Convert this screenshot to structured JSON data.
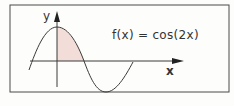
{
  "diagram": {
    "function_label": "f(x) = cos(2x)",
    "x_axis_label": "x",
    "y_axis_label": "y",
    "shaded_region": "area under curve from x=0 to first zero",
    "colors": {
      "line": "#3a3a3a",
      "shade": "#f2ddd8",
      "frame": "#4a4a4a",
      "background": "#fdfdfb"
    }
  }
}
